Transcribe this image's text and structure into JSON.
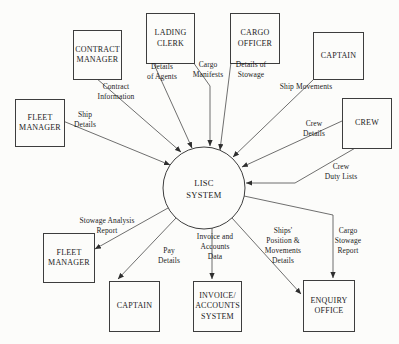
{
  "process": {
    "label": "LISC\nSYSTEM"
  },
  "entities": [
    {
      "name": "contract-manager",
      "label": "CONTRACT\nMANAGER"
    },
    {
      "name": "lading-clerk",
      "label": "LADING\nCLERK"
    },
    {
      "name": "cargo-officer",
      "label": "CARGO\nOFFICER"
    },
    {
      "name": "captain-top",
      "label": "CAPTAIN"
    },
    {
      "name": "fleet-manager-top",
      "label": "FLEET\nMANAGER"
    },
    {
      "name": "crew",
      "label": "CREW"
    },
    {
      "name": "fleet-manager-bottom",
      "label": "FLEET\nMANAGER"
    },
    {
      "name": "captain-bottom",
      "label": "CAPTAIN"
    },
    {
      "name": "invoice-accounts-system",
      "label": "INVOICE/\nACCOUNTS\nSYSTEM"
    },
    {
      "name": "enquiry-office",
      "label": "ENQUIRY\nOFFICE"
    }
  ],
  "flows": [
    {
      "name": "contract-information",
      "label": "Contract\nInformation",
      "from": "contract-manager",
      "to": "lisc-system"
    },
    {
      "name": "ship-details",
      "label": "Ship\nDetails",
      "from": "fleet-manager-top",
      "to": "lisc-system"
    },
    {
      "name": "details-of-agents",
      "label": "Details\nof Agents",
      "from": "lading-clerk",
      "to": "lisc-system"
    },
    {
      "name": "cargo-manifests",
      "label": "Cargo\nManifests",
      "from": "lading-clerk",
      "to": "lisc-system"
    },
    {
      "name": "details-of-stowage",
      "label": "Details of\nStowage",
      "from": "cargo-officer",
      "to": "lisc-system"
    },
    {
      "name": "ship-movements",
      "label": "Ship Movements",
      "from": "captain-top",
      "to": "lisc-system"
    },
    {
      "name": "crew-details",
      "label": "Crew\nDetails",
      "from": "crew",
      "to": "lisc-system"
    },
    {
      "name": "crew-duty-lists",
      "label": "Crew\nDuty Lists",
      "from": "crew",
      "to": "lisc-system"
    },
    {
      "name": "stowage-analysis-report",
      "label": "Stowage Analysis\nReport",
      "from": "lisc-system",
      "to": "fleet-manager-bottom"
    },
    {
      "name": "pay-details",
      "label": "Pay\nDetails",
      "from": "lisc-system",
      "to": "captain-bottom"
    },
    {
      "name": "invoice-and-accounts-data",
      "label": "Invoice and\nAccounts\nData",
      "from": "lisc-system",
      "to": "invoice-accounts-system"
    },
    {
      "name": "ships-position-movements-details",
      "label": "Ships'\nPosition &\nMovements\nDetails",
      "from": "lisc-system",
      "to": "enquiry-office"
    },
    {
      "name": "cargo-stowage-report",
      "label": "Cargo\nStowage\nReport",
      "from": "lisc-system",
      "to": "enquiry-office"
    }
  ]
}
